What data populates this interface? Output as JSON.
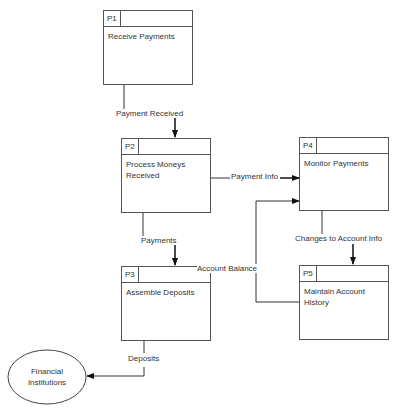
{
  "diagram": {
    "type": "data-flow-diagram",
    "processes": [
      {
        "id": "P1",
        "name": "Receive Payments"
      },
      {
        "id": "P2",
        "name": "Process Moneys Received"
      },
      {
        "id": "P3",
        "name": "Assemble Deposits"
      },
      {
        "id": "P4",
        "name": "Monitor Payments"
      },
      {
        "id": "P5",
        "name": "Maintain Account History"
      }
    ],
    "external_entities": [
      {
        "name": "Financial Institutions"
      }
    ],
    "flows": [
      {
        "from": "P1",
        "to": "P2",
        "label": "Payment Received"
      },
      {
        "from": "P2",
        "to": "P4",
        "label": "Payment Info"
      },
      {
        "from": "P2",
        "to": "P3",
        "label": "Payments"
      },
      {
        "from": "P4",
        "to": "P5",
        "label": "Changes to Account Info"
      },
      {
        "from": "P5",
        "to": "P4",
        "label": "Account Balance"
      },
      {
        "from": "P3",
        "to": "Financial Institutions",
        "label": "Deposits"
      }
    ]
  },
  "p1": {
    "id": "P1",
    "name": "Receive Payments"
  },
  "p2": {
    "id": "P2",
    "name_line1": "Process Moneys",
    "name_line2": "Received"
  },
  "p3": {
    "id": "P3",
    "name": "Assemble Deposits"
  },
  "p4": {
    "id": "P4",
    "name": "Monitor Payments"
  },
  "p5": {
    "id": "P5",
    "name_line1": "Maintain Account",
    "name_line2": "History"
  },
  "entity": {
    "line1": "Financial",
    "line2": "Institutions"
  },
  "labels": {
    "payment_received": "Payment Received",
    "payment_info": "Payment Info",
    "payments": "Payments",
    "changes": "Changes to Account Info",
    "account_balance": "Account Balance",
    "deposits": "Deposits"
  }
}
